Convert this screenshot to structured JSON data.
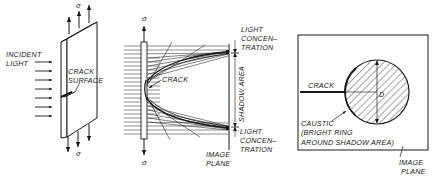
{
  "panel1": {
    "incident_light_line1": "INCIDENT",
    "incident_light_line2": "LIGHT",
    "crack_surface_line1": "CRACK",
    "crack_surface_line2": "SURFACE",
    "sigma_top": "σ",
    "sigma_bottom": "σ"
  },
  "panel2": {
    "sigma_top": "σ",
    "sigma_bottom": "σ",
    "crack": "CRACK",
    "light_conc_top_1": "LIGHT",
    "light_conc_top_2": "CONCEN–",
    "light_conc_top_3": "TRATION",
    "shadow_area": "SHADOW AREA",
    "light_conc_bot_1": "LIGHT",
    "light_conc_bot_2": "CONCEN–",
    "light_conc_bot_3": "TRATION",
    "image_plane_1": "IMAGE",
    "image_plane_2": "PLANE"
  },
  "panel3": {
    "crack": "CRACK",
    "diameter": "D",
    "caustic_1": "CAUSTIC",
    "caustic_2": "(BRIGHT RING",
    "caustic_3": "AROUND SHADOW AREA)",
    "image_plane_1": "IMAGE",
    "image_plane_2": "PLANE"
  }
}
